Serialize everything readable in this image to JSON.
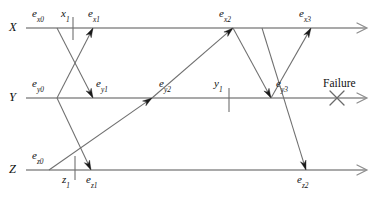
{
  "diagram": {
    "type": "spacetime-timeline",
    "title": "",
    "width": 383,
    "height": 201,
    "colors": {
      "axis": "#8d8d8d",
      "message": "#6f6f6f",
      "arrowhead": "#1a1a1a",
      "text": "#111111",
      "background": "#ffffff"
    },
    "axes": [
      {
        "id": "x",
        "name": "X",
        "label_x": 9,
        "label_y": 21,
        "line_y": 28,
        "x_start": 26,
        "x_end": 366
      },
      {
        "id": "y",
        "name": "Y",
        "label_x": 9,
        "label_y": 91,
        "line_y": 98,
        "x_start": 26,
        "x_end": 366
      },
      {
        "id": "z",
        "name": "Z",
        "label_x": 9,
        "label_y": 163,
        "line_y": 170,
        "x_start": 26,
        "x_end": 366
      }
    ],
    "events": [
      {
        "id": "ex0",
        "base": "e",
        "sub": "x0",
        "axis": "x",
        "label_x": 32,
        "label_y": 8,
        "anchor": "above"
      },
      {
        "id": "ex1",
        "base": "e",
        "sub": "x1",
        "axis": "x",
        "label_x": 88,
        "label_y": 8,
        "anchor": "above"
      },
      {
        "id": "ex2",
        "base": "e",
        "sub": "x2",
        "axis": "x",
        "label_x": 219,
        "label_y": 8,
        "anchor": "above"
      },
      {
        "id": "ex3",
        "base": "e",
        "sub": "x3",
        "axis": "x",
        "label_x": 299,
        "label_y": 8,
        "anchor": "above"
      },
      {
        "id": "ey0",
        "base": "e",
        "sub": "y0",
        "axis": "y",
        "label_x": 32,
        "label_y": 78,
        "anchor": "above"
      },
      {
        "id": "ey1",
        "base": "e",
        "sub": "y1",
        "axis": "y",
        "label_x": 96,
        "label_y": 78,
        "anchor": "above"
      },
      {
        "id": "ey2",
        "base": "e",
        "sub": "y2",
        "axis": "y",
        "label_x": 159,
        "label_y": 78,
        "anchor": "above"
      },
      {
        "id": "ey3",
        "base": "e",
        "sub": "y3",
        "axis": "y",
        "label_x": 276,
        "label_y": 78,
        "anchor": "above"
      },
      {
        "id": "ez0",
        "base": "e",
        "sub": "z0",
        "axis": "z",
        "label_x": 32,
        "label_y": 150,
        "anchor": "above"
      },
      {
        "id": "ez1",
        "base": "e",
        "sub": "z1",
        "axis": "z",
        "label_x": 86,
        "label_y": 174,
        "anchor": "below"
      },
      {
        "id": "ez2",
        "base": "e",
        "sub": "z2",
        "axis": "z",
        "label_x": 297,
        "label_y": 174,
        "anchor": "below"
      }
    ],
    "ticks": [
      {
        "id": "x1",
        "base": "x",
        "sub": "1",
        "axis": "x",
        "x": 73,
        "label_x": 61,
        "label_y": 8,
        "y_top": 17,
        "y_bottom": 40
      },
      {
        "id": "y1",
        "base": "y",
        "sub": "1",
        "axis": "y",
        "x": 229,
        "label_x": 214,
        "label_y": 78,
        "y_top": 88,
        "y_bottom": 112
      },
      {
        "id": "z1",
        "base": "z",
        "sub": "1",
        "axis": "z",
        "x": 75,
        "label_x": 62,
        "label_y": 174,
        "y_top": 156,
        "y_bottom": 180
      }
    ],
    "messages": [
      {
        "id": "m1",
        "from_axis": "y",
        "from_x": 57,
        "to_axis": "x",
        "to_x": 93,
        "note": "ey0-to-ex1"
      },
      {
        "id": "m2",
        "from_axis": "x",
        "from_x": 57,
        "to_axis": "y",
        "to_x": 93,
        "note": "ex0-to-ey1"
      },
      {
        "id": "m3",
        "from_axis": "y",
        "from_x": 57,
        "to_axis": "z",
        "to_x": 91,
        "note": "ey0-to-ez1"
      },
      {
        "id": "m4",
        "from_axis": "z",
        "from_x": 49,
        "to_axis": "y",
        "to_x": 152,
        "note": "ez0-to-ey2"
      },
      {
        "id": "m5",
        "from_axis": "y",
        "from_x": 152,
        "to_axis": "x",
        "to_x": 233,
        "note": "ey2-to-ex2"
      },
      {
        "id": "m6",
        "from_axis": "x",
        "from_x": 233,
        "to_axis": "y",
        "to_x": 271,
        "note": "ex2-to-ey3"
      },
      {
        "id": "m7",
        "from_axis": "y",
        "from_x": 271,
        "to_axis": "x",
        "to_x": 311,
        "note": "ey3-to-ex3"
      },
      {
        "id": "m8",
        "from_axis": "x",
        "from_x": 262,
        "to_axis": "z",
        "to_x": 306,
        "note": "down-to-ez2"
      }
    ],
    "failure": {
      "label": "Failure",
      "label_x": 323,
      "label_y": 78,
      "mark_x": 337,
      "mark_y": 98,
      "mark_size": 7
    }
  }
}
